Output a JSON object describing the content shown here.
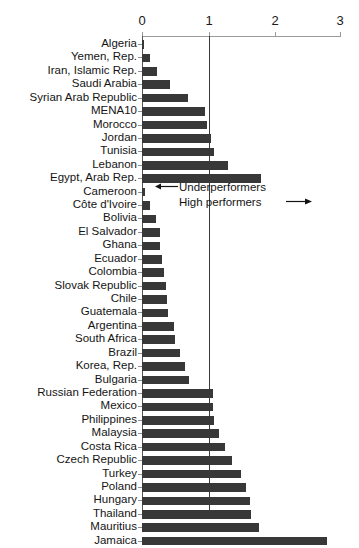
{
  "chart_data": {
    "type": "bar",
    "orientation": "horizontal",
    "title": "",
    "xlabel": "",
    "ylabel": "",
    "xlim": [
      0,
      3
    ],
    "xticks": [
      0,
      1,
      2,
      3
    ],
    "xtick_labels": [
      "0",
      "1",
      "2",
      "3"
    ],
    "grid": false,
    "legend": false,
    "reference_lines": [
      {
        "value": 1,
        "label": "benchmark"
      }
    ],
    "annotations": [
      {
        "text": "Underperformers",
        "arrow": "left",
        "at_value": 1
      },
      {
        "text": "High performers",
        "arrow": "right",
        "at_value": 1
      }
    ],
    "categories": [
      "Algeria",
      "Yemen, Rep.",
      "Iran, Islamic Rep.",
      "Saudi Arabia",
      "Syrian Arab Republic",
      "MENA10",
      "Morocco",
      "Jordan",
      "Tunisia",
      "Lebanon",
      "Egypt, Arab Rep.",
      "Cameroon",
      "Côte d'Ivoire",
      "Bolivia",
      "El Salvador",
      "Ghana",
      "Ecuador",
      "Colombia",
      "Slovak Republic",
      "Chile",
      "Guatemala",
      "Argentina",
      "South Africa",
      "Brazil",
      "Korea, Rep.",
      "Bulgaria",
      "Russian Federation",
      "Mexico",
      "Philippines",
      "Malaysia",
      "Costa Rica",
      "Czech Republic",
      "Turkey",
      "Poland",
      "Hungary",
      "Thailand",
      "Mauritius",
      "Jamaica"
    ],
    "values": [
      0.03,
      0.12,
      0.22,
      0.42,
      0.69,
      0.95,
      0.99,
      1.05,
      1.09,
      1.3,
      1.8,
      0.05,
      0.12,
      0.21,
      0.27,
      0.27,
      0.3,
      0.34,
      0.37,
      0.38,
      0.4,
      0.48,
      0.5,
      0.57,
      0.65,
      0.71,
      1.07,
      1.07,
      1.09,
      1.17,
      1.25,
      1.37,
      1.5,
      1.57,
      1.64,
      1.65,
      1.78,
      2.8
    ],
    "bar_color": "#383838",
    "axis_color": "#9a9a9a"
  }
}
